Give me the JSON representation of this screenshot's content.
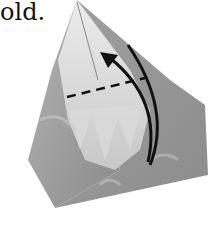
{
  "caption": "old.",
  "figure": {
    "annotations": [
      "dashed fold line",
      "curved fold arrow"
    ],
    "colors": {
      "paper_light": "#e4e4e4",
      "paper_mid": "#a8a8a8",
      "paper_dark": "#7d7d7d",
      "line": "#111111"
    }
  }
}
